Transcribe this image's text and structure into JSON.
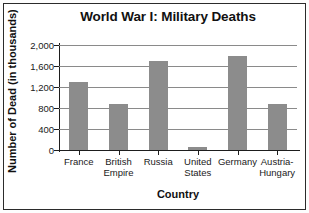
{
  "figure": {
    "frame_border_color": "#2b2b2b",
    "background_color": "#ffffff"
  },
  "chart_data": {
    "type": "bar",
    "title": "World War I: Military Deaths",
    "xlabel": "Country",
    "ylabel": "Number of Dead (in thousands)",
    "categories": [
      "France",
      "British\nEmpire",
      "Russia",
      "United\nStates",
      "Germany",
      "Austria-\nHungary"
    ],
    "values": [
      1300,
      880,
      1700,
      50,
      1800,
      880
    ],
    "ylim": [
      0,
      2000
    ],
    "yticks": [
      0,
      400,
      800,
      1200,
      1600,
      2000
    ],
    "ytick_labels": [
      "0",
      "400",
      "800",
      "1,200",
      "1,600",
      "2,000"
    ],
    "grid": true,
    "grid_axis": "y",
    "legend": false,
    "bar_color": "#8c8c8c",
    "gridline_color": "#8a8a8a",
    "axis_color": "#1d1d1d"
  }
}
